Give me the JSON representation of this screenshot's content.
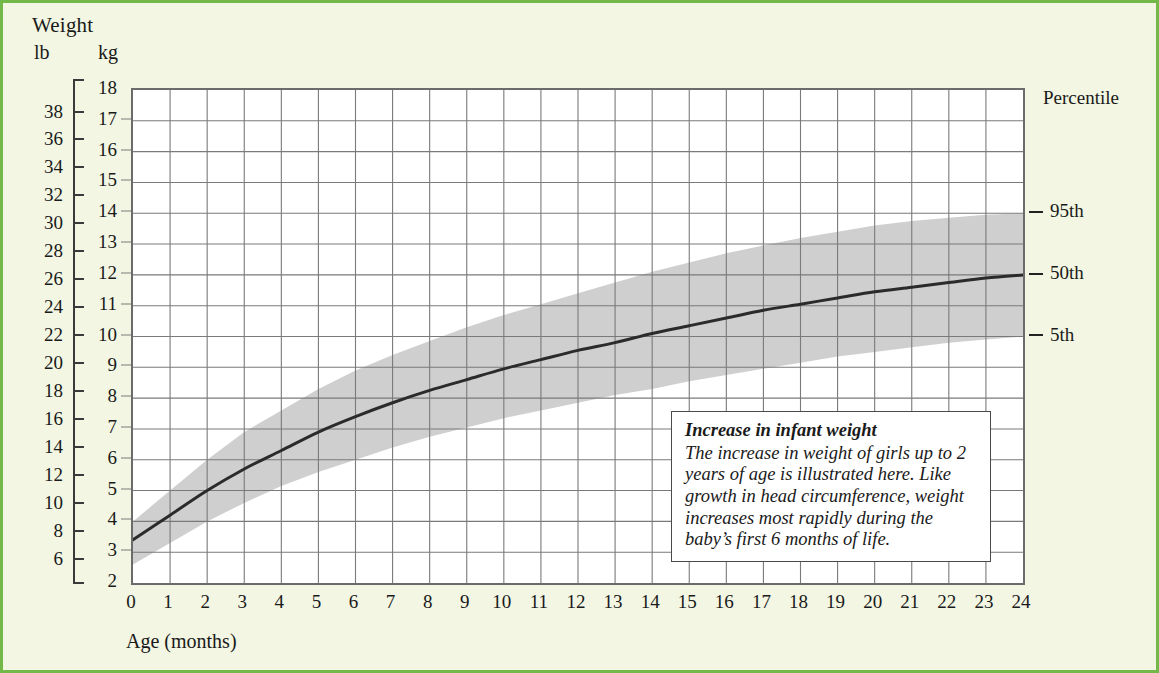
{
  "axes": {
    "weight_title": "Weight",
    "unit_lb": "lb",
    "unit_kg": "kg",
    "x_axis_title": "Age (months)",
    "percentile_title": "Percentile",
    "lb_ticks": [
      38,
      36,
      34,
      32,
      30,
      28,
      26,
      24,
      22,
      20,
      18,
      16,
      14,
      12,
      10,
      8,
      6
    ],
    "kg_ticks": [
      18,
      17,
      16,
      15,
      14,
      13,
      12,
      11,
      10,
      9,
      8,
      7,
      6,
      5,
      4,
      3,
      2
    ],
    "x_ticks": [
      0,
      1,
      2,
      3,
      4,
      5,
      6,
      7,
      8,
      9,
      10,
      11,
      12,
      13,
      14,
      15,
      16,
      17,
      18,
      19,
      20,
      21,
      22,
      23,
      24
    ]
  },
  "percentiles": [
    {
      "label": "95th",
      "kg": 14.0
    },
    {
      "label": "50th",
      "kg": 12.0
    },
    {
      "label": "5th",
      "kg": 10.0
    }
  ],
  "caption": {
    "title": "Increase in infant weight",
    "body": "The increase in weight of girls up to 2 years of age is illustrated here. Like growth in head circumference, weight increases most rapidly during the baby’s first 6 months of life."
  },
  "colors": {
    "page_background": "#f2f6e2",
    "page_border": "#73b94a",
    "plot_background": "#ffffff",
    "grid_line": "#7a7a7a",
    "plot_frame": "#6b6b6b",
    "band_fill": "#cfcfcf",
    "curve": "#2b2b2b",
    "text": "#1a1a1a"
  },
  "chart_data": {
    "type": "line",
    "title": "Increase in infant weight",
    "xlabel": "Age (months)",
    "ylabel": "Weight",
    "xlim": [
      0,
      24
    ],
    "ylim": [
      2,
      18
    ],
    "y_unit_primary": "kg",
    "y_unit_secondary": "lb",
    "grid": true,
    "legend_position": "right",
    "x": [
      0,
      1,
      2,
      3,
      4,
      5,
      6,
      7,
      8,
      9,
      10,
      11,
      12,
      13,
      14,
      15,
      16,
      17,
      18,
      19,
      20,
      21,
      22,
      23,
      24
    ],
    "series": [
      {
        "name": "50th percentile",
        "type": "line",
        "values": [
          3.4,
          4.2,
          5.0,
          5.7,
          6.3,
          6.9,
          7.4,
          7.85,
          8.25,
          8.6,
          8.95,
          9.25,
          9.55,
          9.8,
          10.1,
          10.35,
          10.6,
          10.85,
          11.05,
          11.25,
          11.45,
          11.6,
          11.75,
          11.9,
          12.0
        ]
      },
      {
        "name": "95th percentile",
        "type": "band-upper",
        "values": [
          4.0,
          5.0,
          6.0,
          6.9,
          7.6,
          8.3,
          8.9,
          9.4,
          9.85,
          10.3,
          10.7,
          11.05,
          11.4,
          11.75,
          12.1,
          12.4,
          12.7,
          12.95,
          13.2,
          13.4,
          13.6,
          13.75,
          13.85,
          13.95,
          14.0
        ]
      },
      {
        "name": "5th percentile",
        "type": "band-lower",
        "values": [
          2.6,
          3.3,
          4.0,
          4.6,
          5.15,
          5.6,
          6.0,
          6.4,
          6.75,
          7.05,
          7.35,
          7.6,
          7.85,
          8.1,
          8.3,
          8.55,
          8.75,
          8.95,
          9.15,
          9.35,
          9.5,
          9.65,
          9.8,
          9.9,
          10.0
        ]
      }
    ]
  }
}
